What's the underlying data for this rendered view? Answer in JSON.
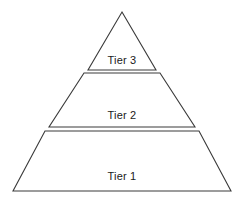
{
  "diagram": {
    "type": "pyramid",
    "background_color": "#ffffff",
    "stroke_color": "#3a3a3a",
    "fill_color": "#ffffff",
    "tiers": [
      {
        "id": "tier-3",
        "label": "Tier 3",
        "level": 3,
        "position": "top",
        "shape": "triangle",
        "points": "122,12 156,70 88,70",
        "label_x": 122,
        "label_y": 64
      },
      {
        "id": "tier-2",
        "label": "Tier 2",
        "level": 2,
        "position": "middle",
        "shape": "trapezoid",
        "points": "84,73 160,73 195,127 49,127",
        "label_x": 122,
        "label_y": 119
      },
      {
        "id": "tier-1",
        "label": "Tier 1",
        "level": 1,
        "position": "bottom",
        "shape": "trapezoid",
        "points": "45,131 199,131 231,191 13,191",
        "label_x": 122,
        "label_y": 180
      }
    ]
  }
}
